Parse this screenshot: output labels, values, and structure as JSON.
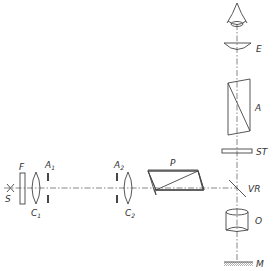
{
  "diagram": {
    "type": "optical-schematic",
    "components": {
      "source": {
        "label": "S"
      },
      "filter": {
        "label": "F"
      },
      "collector_lens_1": {
        "label": "C",
        "sub": "1"
      },
      "aperture_1": {
        "label": "A",
        "sub": "1"
      },
      "aperture_2": {
        "label": "A",
        "sub": "2"
      },
      "collector_lens_2": {
        "label": "C",
        "sub": "2"
      },
      "polarizer": {
        "label": "P"
      },
      "eyepiece": {
        "label": "E"
      },
      "analyzer": {
        "label": "A"
      },
      "compensator_plate": {
        "label": "ST"
      },
      "vertical_reflector": {
        "label": "VR"
      },
      "objective": {
        "label": "O"
      },
      "specimen_mirror": {
        "label": "M"
      }
    },
    "colors": {
      "line": "#444444",
      "axis": "#555555",
      "background": "#ffffff"
    }
  }
}
